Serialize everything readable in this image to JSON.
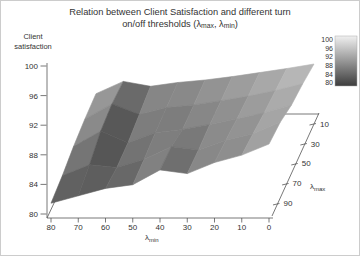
{
  "figure": {
    "background": "#ffffff",
    "border_color": "#cccccc",
    "title": {
      "line1": "Relation between Client Satisfaction and different turn",
      "line2_pre": "on/off thresholds (λ",
      "line2_sub1": "max",
      "line2_mid": ", λ",
      "line2_sub2": "min",
      "line2_post": ")"
    }
  },
  "chart_data": {
    "type": "surface",
    "title": "Relation between Client Satisfaction and different turn on/off thresholds (λmax, λmin)",
    "x_axis": {
      "label": "λmin",
      "label_pre": "λ",
      "label_sub": "min",
      "ticks": [
        80,
        70,
        60,
        50,
        40,
        30,
        20,
        10,
        0
      ]
    },
    "depth_axis": {
      "label": "λmax",
      "label_pre": "λ",
      "label_sub": "max",
      "ticks": [
        90,
        70,
        50,
        30,
        10
      ]
    },
    "z_axis": {
      "label": "Client satisfaction",
      "label_lines": [
        "Client",
        "satisfaction"
      ],
      "ticks": [
        100,
        96,
        92,
        88,
        84,
        80
      ],
      "range": [
        80,
        100
      ]
    },
    "colorbar": {
      "ticks": [
        100,
        96,
        92,
        88,
        84,
        80
      ],
      "range": [
        80,
        100
      ],
      "color_high": "#f0f0f0",
      "color_low": "#3d3d3d"
    },
    "surface": {
      "lambda_min": [
        80,
        70,
        60,
        50,
        40,
        30,
        20,
        10,
        0
      ],
      "lambda_max": [
        90,
        70,
        50,
        30,
        10
      ],
      "satisfaction": [
        [
          82.0,
          83.0,
          84.0,
          84.5,
          86.5,
          86.0,
          87.5,
          88.5,
          90.0
        ],
        [
          82.5,
          84.2,
          83.8,
          85.0,
          87.0,
          86.5,
          88.0,
          89.0,
          90.8
        ],
        [
          83.5,
          86.3,
          84.2,
          86.0,
          86.6,
          87.5,
          88.5,
          89.6,
          91.0
        ],
        [
          84.5,
          87.8,
          85.5,
          87.0,
          87.6,
          88.5,
          89.5,
          90.7,
          92.2
        ],
        [
          85.5,
          88.8,
          87.5,
          88.5,
          89.2,
          90.1,
          91.2,
          92.3,
          93.5
        ]
      ]
    }
  }
}
